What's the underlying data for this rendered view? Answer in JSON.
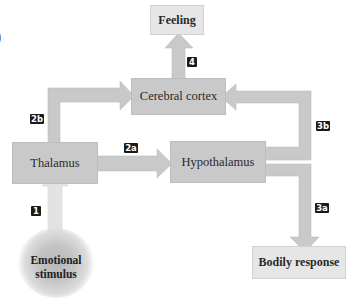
{
  "diagram": {
    "type": "flowchart",
    "fragment_text": ")",
    "nodes": {
      "feeling": {
        "label": "Feeling"
      },
      "cortex": {
        "label": "Cerebral cortex"
      },
      "thalamus": {
        "label": "Thalamus"
      },
      "hypothalamus": {
        "label": "Hypothalamus"
      },
      "bodily": {
        "label": "Bodily response"
      },
      "stimulus": {
        "line1": "Emotional",
        "line2": "stimulus"
      }
    },
    "steps": {
      "s1": "1",
      "s2a": "2a",
      "s2b": "2b",
      "s3a": "3a",
      "s3b": "3b",
      "s4": "4"
    },
    "edges": [
      {
        "id": "1",
        "from": "Emotional stimulus",
        "to": "Thalamus"
      },
      {
        "id": "2a",
        "from": "Thalamus",
        "to": "Hypothalamus"
      },
      {
        "id": "2b",
        "from": "Thalamus",
        "to": "Cerebral cortex"
      },
      {
        "id": "3a",
        "from": "Hypothalamus",
        "to": "Bodily response"
      },
      {
        "id": "3b",
        "from": "Hypothalamus",
        "to": "Cerebral cortex"
      },
      {
        "id": "4",
        "from": "Cerebral cortex",
        "to": "Feeling"
      }
    ],
    "colors": {
      "node_dark": "#c9c9c9",
      "node_light": "#e6e6e6",
      "arrow": "#c9c9c9",
      "arrow_light": "#e3e3e3",
      "tag_bg": "#1a1a1a",
      "tag_text": "#ffffff"
    }
  }
}
